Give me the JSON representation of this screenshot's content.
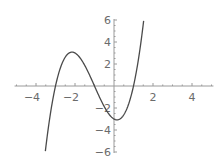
{
  "chart_data": {
    "type": "line",
    "title": "",
    "xlabel": "",
    "ylabel": "",
    "function": "x^3 + 3x^2 - x - 3",
    "xlim": [
      -5.1,
      5.1
    ],
    "ylim": [
      -6,
      6
    ],
    "grid": false,
    "legend": null,
    "x_ticks": [
      -4,
      -2,
      2,
      4
    ],
    "y_ticks": [
      -6,
      -4,
      -2,
      2,
      4,
      6
    ],
    "x_tick_labels": [
      "-4",
      "-2",
      "2",
      "4"
    ],
    "y_tick_labels": [
      "-6",
      "-4",
      "-2",
      "2",
      "4",
      "6"
    ],
    "series": [
      {
        "name": "f(x)",
        "x": [
          -3.52,
          -3.4,
          -3.2,
          -3.0,
          -2.8,
          -2.6,
          -2.4,
          -2.2,
          -2.0,
          -1.8,
          -1.6,
          -1.4,
          -1.2,
          -1.0,
          -0.8,
          -0.6,
          -0.4,
          -0.2,
          0.0,
          0.2,
          0.4,
          0.6,
          0.8,
          1.0,
          1.2,
          1.4,
          1.52
        ],
        "y": [
          -6.0,
          -4.54,
          -2.18,
          0.0,
          1.73,
          2.86,
          3.46,
          3.08,
          3.0,
          2.69,
          2.21,
          1.54,
          0.79,
          0.0,
          -0.79,
          -1.54,
          -2.18,
          -2.69,
          -3.0,
          -3.07,
          -2.98,
          -2.57,
          -1.76,
          0.0,
          1.25,
          3.22,
          5.9
        ]
      }
    ],
    "notable_points": {
      "roots": [
        -3,
        -1,
        1
      ],
      "local_max": {
        "x": -2.15,
        "y": 3.08
      },
      "local_min": {
        "x": 0.15,
        "y": -3.08
      },
      "y_intercept": -3
    }
  },
  "axes": {
    "x_labels": [
      {
        "value": -4,
        "text": "-4"
      },
      {
        "value": -2,
        "text": "-2"
      },
      {
        "value": 2,
        "text": "2"
      },
      {
        "value": 4,
        "text": "4"
      }
    ],
    "y_labels": [
      {
        "value": 6,
        "text": "6"
      },
      {
        "value": 4,
        "text": "4"
      },
      {
        "value": 2,
        "text": "2"
      },
      {
        "value": -2,
        "text": "-2"
      },
      {
        "value": -4,
        "text": "-4"
      },
      {
        "value": -6,
        "text": "-6"
      }
    ]
  },
  "colors": {
    "curve": "#4a4a4a",
    "axis": "#9a9a9a",
    "label": "#6b6b6b",
    "background": "#ffffff"
  }
}
